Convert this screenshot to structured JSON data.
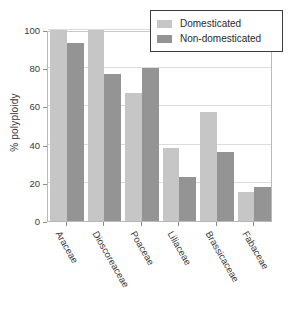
{
  "chart_data": {
    "type": "bar",
    "title": "",
    "xlabel": "",
    "ylabel": "% polyploidy",
    "ylim": [
      0,
      100
    ],
    "yticks": [
      0,
      20,
      40,
      60,
      80,
      100
    ],
    "ytick_labels": [
      "0",
      "20",
      "40",
      "60",
      "80",
      "100"
    ],
    "grid": true,
    "legend_position": "top-right",
    "categories": [
      "Araceae",
      "Dioscoreaceae",
      "Poaceae",
      "Liliaceae",
      "Brassicaceae",
      "Fabaceae"
    ],
    "series": [
      {
        "name": "Domesticated",
        "color": "#c6c6c6",
        "values": [
          100,
          100,
          67,
          38,
          57,
          15
        ]
      },
      {
        "name": "Non-domesticated",
        "color": "#949494",
        "values": [
          93,
          77,
          80,
          23,
          36,
          18
        ]
      }
    ]
  },
  "legend": {
    "items": [
      {
        "label": "Domesticated",
        "color": "#c6c6c6"
      },
      {
        "label": "Non-domesticated",
        "color": "#949494"
      }
    ]
  },
  "axis": {
    "y_title": "% polyploidy"
  }
}
